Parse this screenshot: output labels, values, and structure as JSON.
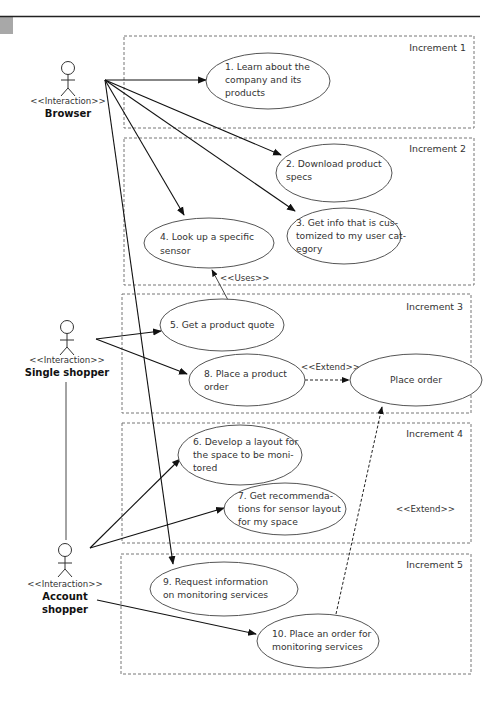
{
  "figure": {
    "header_rule_color": "#222222",
    "corner_tab_color": "#a8a8a8"
  },
  "increments": [
    {
      "label": "Increment 1"
    },
    {
      "label": "Increment 2"
    },
    {
      "label": "Increment 3"
    },
    {
      "label": "Increment 4"
    },
    {
      "label": "Increment 5"
    }
  ],
  "actors": [
    {
      "stereotype": "<<Interaction>>",
      "name_lines": [
        "Browser"
      ]
    },
    {
      "stereotype": "<<Interaction>>",
      "name_lines": [
        "Single shopper"
      ]
    },
    {
      "stereotype": "<<Interaction>>",
      "name_lines": [
        "Account",
        "shopper"
      ]
    }
  ],
  "use_cases": {
    "uc1": {
      "lines": [
        "1. Learn about the",
        "company and its",
        "products"
      ]
    },
    "uc2": {
      "lines": [
        "2. Download product",
        "specs"
      ]
    },
    "uc3": {
      "lines": [
        "3. Get info that is cus-",
        "tomized to my user cat-",
        "egory"
      ]
    },
    "uc4": {
      "lines": [
        "4. Look up a specific",
        "sensor"
      ]
    },
    "uc5": {
      "lines": [
        "5. Get a product quote"
      ]
    },
    "uc6": {
      "lines": [
        "6. Develop a layout for",
        "the space to be moni-",
        "tored"
      ]
    },
    "uc7": {
      "lines": [
        "7. Get recommenda-",
        "tions for sensor layout",
        "for my space"
      ]
    },
    "uc8": {
      "lines": [
        "8. Place a product",
        "order"
      ]
    },
    "uc9": {
      "lines": [
        "9. Request information",
        "on monitoring services"
      ]
    },
    "uc10": {
      "lines": [
        "10. Place an order for",
        "monitoring services"
      ]
    },
    "place_order": {
      "lines": [
        "Place order"
      ]
    }
  },
  "relationships": {
    "uses_label": "<<Uses>>",
    "extend_label_1": "<<Extend>>",
    "extend_label_2": "<<Extend>>"
  }
}
